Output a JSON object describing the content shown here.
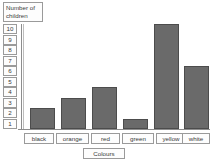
{
  "chart_data": {
    "type": "bar",
    "title": "",
    "categories": [
      "black",
      "orange",
      "red",
      "green",
      "yellow",
      "white"
    ],
    "values": [
      2,
      3,
      4,
      1,
      10,
      6
    ],
    "xlabel": "Colours",
    "ylabel": "Number of children",
    "ylabel_line1": "Number of",
    "ylabel_line2": "children",
    "yticks": [
      "10",
      "9",
      "8",
      "7",
      "6",
      "5",
      "4",
      "3",
      "2",
      "1"
    ],
    "ylim": [
      0,
      10
    ],
    "grid": false,
    "legend": false,
    "bar_color": "#6a6a6a",
    "bar_edge_color": "#4c4c4c",
    "axis_color": "#8d8d8d",
    "label_box_border": "#9a9a9a",
    "background": "#ffffff"
  }
}
